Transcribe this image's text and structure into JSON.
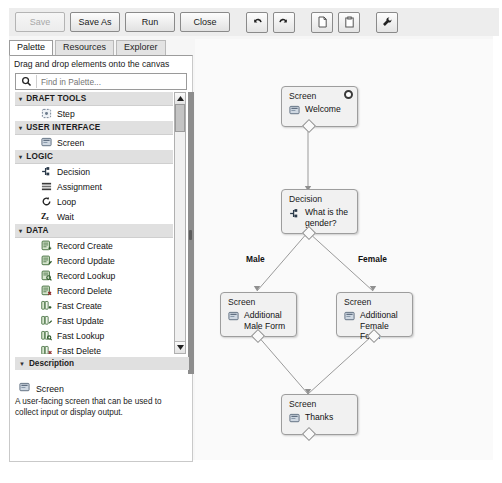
{
  "toolbar": {
    "buttons": [
      {
        "label": "Save",
        "disabled": true
      },
      {
        "label": "Save As",
        "disabled": false
      },
      {
        "label": "Run",
        "disabled": false
      },
      {
        "label": "Close",
        "disabled": false
      }
    ],
    "icons": [
      "undo-icon",
      "redo-icon",
      "copy-icon",
      "paste-icon",
      "wrench-icon"
    ]
  },
  "tabs": [
    {
      "label": "Palette",
      "active": true
    },
    {
      "label": "Resources",
      "active": false
    },
    {
      "label": "Explorer",
      "active": false
    }
  ],
  "palette": {
    "hint": "Drag and drop elements onto the canvas",
    "search": {
      "value": "",
      "placeholder": "Find in Palette...",
      "icon": "search-icon"
    },
    "groups": [
      {
        "name": "DRAFT TOOLS",
        "expanded": true,
        "items": [
          {
            "label": "Step",
            "icon": "step-icon"
          }
        ]
      },
      {
        "name": "USER INTERFACE",
        "expanded": true,
        "items": [
          {
            "label": "Screen",
            "icon": "screen-icon"
          }
        ]
      },
      {
        "name": "LOGIC",
        "expanded": true,
        "items": [
          {
            "label": "Decision",
            "icon": "decision-icon"
          },
          {
            "label": "Assignment",
            "icon": "assignment-icon"
          },
          {
            "label": "Loop",
            "icon": "loop-icon"
          },
          {
            "label": "Wait",
            "icon": "wait-icon"
          }
        ]
      },
      {
        "name": "DATA",
        "expanded": true,
        "items": [
          {
            "label": "Record Create",
            "icon": "record-create-icon"
          },
          {
            "label": "Record Update",
            "icon": "record-update-icon"
          },
          {
            "label": "Record Lookup",
            "icon": "record-lookup-icon"
          },
          {
            "label": "Record Delete",
            "icon": "record-delete-icon"
          },
          {
            "label": "Fast Create",
            "icon": "fast-create-icon"
          },
          {
            "label": "Fast Update",
            "icon": "fast-update-icon"
          },
          {
            "label": "Fast Lookup",
            "icon": "fast-lookup-icon"
          },
          {
            "label": "Fast Delete",
            "icon": "fast-delete-icon"
          }
        ]
      }
    ]
  },
  "description": {
    "header": "Description",
    "title": "Screen",
    "icon": "screen-icon",
    "body": "A user-facing screen that can be used to collect input or display output."
  },
  "flow": {
    "nodes": [
      {
        "id": "welcome",
        "type": "Screen",
        "label": "Welcome",
        "icon": "screen-icon",
        "is_start": true
      },
      {
        "id": "gender",
        "type": "Decision",
        "label": "What is the gender?",
        "icon": "decision-icon",
        "is_start": false
      },
      {
        "id": "male",
        "type": "Screen",
        "label": "Additional Male Form",
        "icon": "screen-icon",
        "is_start": false
      },
      {
        "id": "female",
        "type": "Screen",
        "label": "Additional Female Form",
        "icon": "screen-icon",
        "is_start": false
      },
      {
        "id": "thanks",
        "type": "Screen",
        "label": "Thanks",
        "icon": "screen-icon",
        "is_start": false
      }
    ],
    "edge_labels": [
      {
        "id": "male-label",
        "text": "Male"
      },
      {
        "id": "female-label",
        "text": "Female"
      }
    ]
  },
  "colors": {
    "node_fill": "#f1f1f1",
    "node_border": "#9d9d9d",
    "canvas_bg": "#fafafa",
    "group_header": "#e0e0e0",
    "splitter": "#8d8d8d"
  }
}
